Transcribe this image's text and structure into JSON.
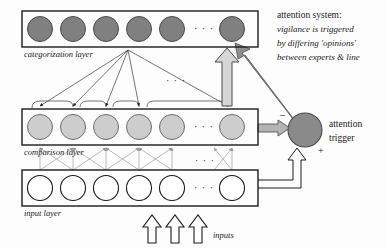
{
  "diagram": {
    "ellipsis": "· · ·",
    "layers": [
      {
        "id": "categorization",
        "label": "categorization layer",
        "node_count": 6,
        "node_fill": "#808080",
        "node_stroke": "#4a4a4a",
        "box": {
          "x": 22,
          "y": 11,
          "w": 236,
          "h": 36
        },
        "label_pos": {
          "x": 24,
          "y": 57
        }
      },
      {
        "id": "comparison",
        "label": "comparison layer",
        "node_count": 6,
        "node_fill": "#cdcdcd",
        "node_stroke": "#6e6e6e",
        "box": {
          "x": 22,
          "y": 109,
          "w": 236,
          "h": 36
        },
        "label_pos": {
          "x": 24,
          "y": 155
        }
      },
      {
        "id": "input",
        "label": "input layer",
        "node_count": 6,
        "node_fill": "#ffffff",
        "node_stroke": "#1a1a1a",
        "box": {
          "x": 22,
          "y": 170,
          "w": 236,
          "h": 36
        },
        "label_pos": {
          "x": 24,
          "y": 216
        }
      }
    ],
    "node_centers_x": [
      40,
      73,
      106,
      139,
      172,
      232
    ],
    "ellipsis_x": 205,
    "attention_trigger": {
      "label_line1": "attention",
      "label_line2": "trigger",
      "fill": "#8a8a8a",
      "stroke": "#4a4a4a",
      "cx": 305,
      "cy": 130,
      "r": 17,
      "label_pos": {
        "x": 329,
        "y": 127
      }
    },
    "annotation": {
      "line1": "attention system:",
      "line2": "vigilance is triggered",
      "line3": "by differing 'opinions'",
      "line4": "between experts & line",
      "x": 277,
      "y": 16
    },
    "inputs": {
      "label": "inputs",
      "label_pos": {
        "x": 200,
        "y": 236
      },
      "arrow_count": 3,
      "arrow_xs": [
        152,
        175,
        198
      ]
    },
    "signs": {
      "minus": "–",
      "minus_pos": {
        "x": 280,
        "y": 118
      },
      "plus": "+",
      "plus_pos": {
        "x": 321,
        "y": 151
      }
    },
    "colors": {
      "ink": "#1a1a1a",
      "gray_arrow_fill": "#b4b4b4",
      "gray_arrow_stroke": "#555555",
      "thick_arrow_fill": "#8f8f8f",
      "fanline": "#3a3a3a",
      "crossline": "#a8a8a8",
      "background": "#fdfdfd"
    }
  }
}
